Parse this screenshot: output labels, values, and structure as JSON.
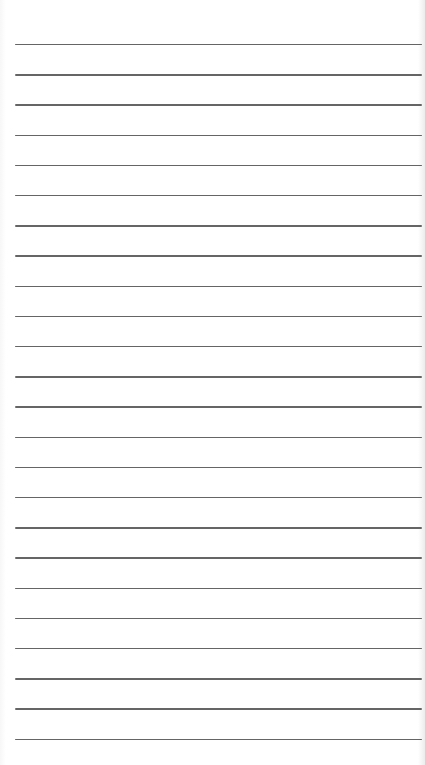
{
  "paper": {
    "type": "lined-paper",
    "background_color": "#ffffff",
    "line_color": "#4a4a4a",
    "line_count": 24,
    "first_line_y": 44,
    "line_spacing": 30.2,
    "line_left_x": 15,
    "line_right_x": 422
  }
}
